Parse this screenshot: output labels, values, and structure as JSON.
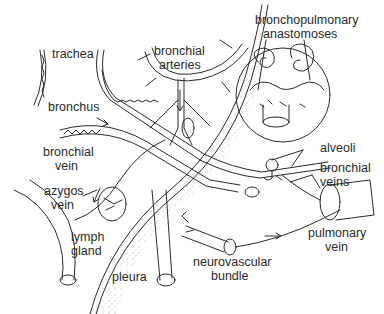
{
  "diagram": {
    "type": "anatomical illustration",
    "colors": {
      "line": "#2a2a2a",
      "background": "#ffffff",
      "stipple": "#9a9a9a"
    },
    "labels": {
      "trachea": "trachea",
      "bronchial_arteries_1": "bronchial",
      "bronchial_arteries_2": "arteries",
      "bronchopulmonary_1": "bronchopulmonary",
      "bronchopulmonary_2": "anastomoses",
      "bronchus": "bronchus",
      "bronchial_vein_1": "bronchial",
      "bronchial_vein_2": "vein",
      "alveoli": "alveoli",
      "bronchial_veins_1": "bronchial",
      "bronchial_veins_2": "veins",
      "azygos_vein_1": "azygos",
      "azygos_vein_2": "vein",
      "lymph_gland_1": "lymph",
      "lymph_gland_2": "gland",
      "pulmonary_vein_1": "pulmonary",
      "pulmonary_vein_2": "vein",
      "neurovascular_bundle_1": "neurovascular",
      "neurovascular_bundle_2": "bundle",
      "pleura": "pleura"
    }
  }
}
